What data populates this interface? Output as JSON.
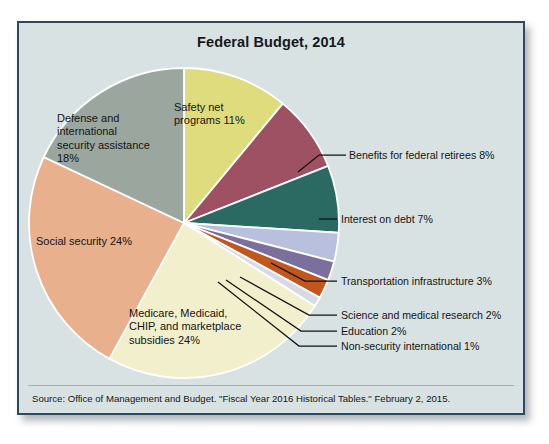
{
  "figure": {
    "title": "Federal Budget, 2014",
    "source": "Source: Office of Management and Budget. \"Fiscal Year 2016 Historical Tables.\" February 2, 2015."
  },
  "labels": {
    "safety_net": "Safety net\nprograms 11%",
    "defense": "Defense and\ninternational\nsecurity assistance\n18%",
    "social_security": "Social security 24%",
    "medicare": "Medicare, Medicaid,\nCHIP, and marketplace\nsubsidies 24%",
    "retirees": "Benefits for federal retirees 8%",
    "interest": "Interest on debt 7%",
    "transportation": "Transportation infrastructure 3%",
    "science": "Science and medical research 2%",
    "education": "Education 2%",
    "nonsecurity": "Non-security international 1%"
  },
  "chart_data": {
    "type": "pie",
    "title": "Federal Budget, 2014",
    "xlabel": "",
    "ylabel": "",
    "units": "percent of total federal budget",
    "start_angle_deg": 0,
    "direction": "clockwise",
    "legend": "none (direct labels and callouts)",
    "categories": [
      "Safety net programs",
      "Benefits for federal retirees",
      "Interest on debt",
      "Transportation infrastructure",
      "Science and medical research",
      "Education",
      "Non-security international",
      "Medicare, Medicaid, CHIP, and marketplace subsidies",
      "Social security",
      "Defense and international security assistance"
    ],
    "values": [
      11,
      8,
      7,
      3,
      2,
      2,
      1,
      24,
      24,
      18
    ],
    "colors": [
      "#dfdc7e",
      "#9e5163",
      "#2a6a63",
      "#b9c0dd",
      "#7b6f9e",
      "#c1561f",
      "#d7d9e6",
      "#f2efcd",
      "#e8b08c",
      "#9aa69e"
    ],
    "slices": [
      {
        "label": "Safety net programs",
        "value": 11,
        "display": "11%",
        "color": "#dfdc7e"
      },
      {
        "label": "Benefits for federal retirees",
        "value": 8,
        "display": "8%",
        "color": "#9e5163"
      },
      {
        "label": "Interest on debt",
        "value": 7,
        "display": "7%",
        "color": "#2a6a63"
      },
      {
        "label": "Transportation infrastructure",
        "value": 3,
        "display": "3%",
        "color": "#b9c0dd"
      },
      {
        "label": "Science and medical research",
        "value": 2,
        "display": "2%",
        "color": "#7b6f9e"
      },
      {
        "label": "Education",
        "value": 2,
        "display": "2%",
        "color": "#c1561f"
      },
      {
        "label": "Non-security international",
        "value": 1,
        "display": "1%",
        "color": "#d7d9e6"
      },
      {
        "label": "Medicare, Medicaid, CHIP, and marketplace subsidies",
        "value": 24,
        "display": "24%",
        "color": "#f2efcd"
      },
      {
        "label": "Social security",
        "value": 24,
        "display": "24%",
        "color": "#e8b08c"
      },
      {
        "label": "Defense and international security assistance",
        "value": 18,
        "display": "18%",
        "color": "#9aa69e"
      }
    ]
  },
  "style": {
    "panel_bg": "#d8e2e2",
    "panel_border": "#2a4a63",
    "slice_outline": "#ffffff",
    "text": "#141414"
  }
}
